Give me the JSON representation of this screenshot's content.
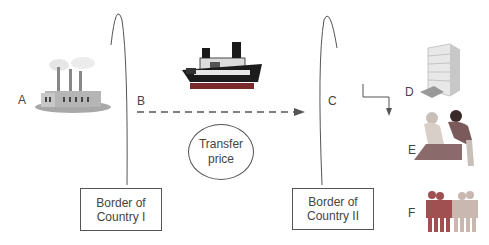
{
  "diagram": {
    "nodes": {
      "a": {
        "label": "A",
        "icon": "factory-icon"
      },
      "b": {
        "label": "B",
        "icon": "ship-icon"
      },
      "c": {
        "label": "C"
      },
      "d": {
        "label": "D",
        "icon": "office-building-icon"
      },
      "e": {
        "label": "E",
        "icon": "people-working-icon"
      },
      "f": {
        "label": "F",
        "icon": "people-group-icon"
      }
    },
    "transfer_price": {
      "line1": "Transfer",
      "line2": "price"
    },
    "border_1": {
      "line1": "Border of",
      "line2": "Country I"
    },
    "border_2": {
      "line1": "Border of",
      "line2": "Country II"
    },
    "colors": {
      "line": "#555555",
      "ship_dark": "#1a1a1a",
      "ship_hull": "#7a2a2a",
      "factory": "#9a9a9a",
      "people_red": "#a05050",
      "people_light": "#c8b8b0"
    }
  }
}
